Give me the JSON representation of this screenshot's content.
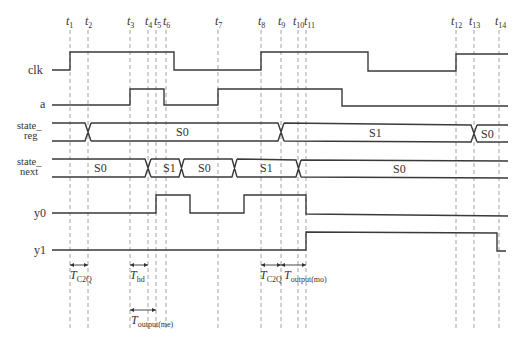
{
  "diagram": {
    "type": "timing-diagram",
    "time_markers": [
      {
        "label": "t",
        "sub": "1",
        "x": 70
      },
      {
        "label": "t",
        "sub": "2",
        "x": 88
      },
      {
        "label": "t",
        "sub": "3",
        "x": 130
      },
      {
        "label": "t",
        "sub": "4",
        "x": 148
      },
      {
        "label": "t",
        "sub": "5",
        "x": 156
      },
      {
        "label": "t",
        "sub": "6",
        "x": 166
      },
      {
        "label": "t",
        "sub": "7",
        "x": 218
      },
      {
        "label": "t",
        "sub": "8",
        "x": 261
      },
      {
        "label": "t",
        "sub": "9",
        "x": 281
      },
      {
        "label": "t",
        "sub": "10",
        "x": 298
      },
      {
        "label": "t",
        "sub": "11",
        "x": 306
      },
      {
        "label": "t",
        "sub": "12",
        "x": 456
      },
      {
        "label": "t",
        "sub": "13",
        "x": 474
      },
      {
        "label": "t",
        "sub": "14",
        "x": 499
      }
    ],
    "signals": [
      {
        "name": "clk",
        "label": "clk",
        "kind": "digital",
        "waveform": "low until t1, high t1–t6, low t6–t8, high t8–~368, low ~368–t12, high t12–end"
      },
      {
        "name": "a",
        "label": "a",
        "kind": "digital",
        "waveform": "low until t3, high t3–t6, low t6–t7, high t7–~343, low after"
      },
      {
        "name": "state_reg",
        "label_line1": "state_",
        "label_line2": "reg",
        "kind": "bus",
        "segments": [
          {
            "value": "",
            "from": "start",
            "to": "t2"
          },
          {
            "value": "S0",
            "from": "t2",
            "to": "t9"
          },
          {
            "value": "S1",
            "from": "t9",
            "to": "t13"
          },
          {
            "value": "S0",
            "from": "t13",
            "to": "end"
          }
        ]
      },
      {
        "name": "state_next",
        "label_line1": "state_",
        "label_line2": "next",
        "kind": "bus",
        "segments": [
          {
            "value": "S0",
            "from": "start",
            "to": "t4"
          },
          {
            "value": "S1",
            "from": "t4",
            "to": "t6"
          },
          {
            "value": "S0",
            "from": "t6",
            "to": "~t7"
          },
          {
            "value": "S1",
            "from": "~t7",
            "to": "t10"
          },
          {
            "value": "S0",
            "from": "t10",
            "to": "end"
          }
        ]
      },
      {
        "name": "y0",
        "label": "y0",
        "kind": "digital",
        "waveform": "low until t5, high t5–~190, low ~190–~244, high ~244–t11, low after"
      },
      {
        "name": "y1",
        "label": "y1",
        "kind": "digital",
        "waveform": "low until t11, high t11–t14, low after"
      }
    ],
    "annotations": [
      {
        "name": "t-c2q-1",
        "text": "T",
        "sub": "C2Q",
        "from": "t1",
        "to": "t2"
      },
      {
        "name": "t-hd",
        "text": "T",
        "sub": "hd",
        "from": "t3",
        "to": "t4"
      },
      {
        "name": "t-output-me",
        "text": "T",
        "sub": "output(me)",
        "from": "t3",
        "to": "t5"
      },
      {
        "name": "t-c2q-2",
        "text": "T",
        "sub": "C2Q",
        "from": "t8",
        "to": "t9"
      },
      {
        "name": "t-output-mo",
        "text": "T",
        "sub": "output(mo)",
        "from": "t9",
        "to": "t11"
      }
    ],
    "colors": {
      "line": "#3a3a3a",
      "guide": "#8a8a8a",
      "background": "#ffffff"
    }
  }
}
